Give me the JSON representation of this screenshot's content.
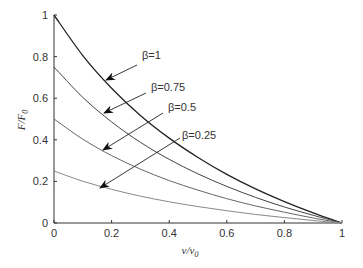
{
  "chart_data": {
    "type": "line",
    "title": "",
    "xlabel": "v/v0",
    "ylabel": "F/F0",
    "xlim": [
      0,
      1
    ],
    "ylim": [
      0,
      1
    ],
    "grid": false,
    "xticks": [
      "0",
      "0.2",
      "0.4",
      "0.6",
      "0.8",
      "1"
    ],
    "yticks": [
      "0",
      "0.2",
      "0.4",
      "0.6",
      "0.8",
      "1"
    ],
    "x": [
      0,
      0.1,
      0.2,
      0.3,
      0.4,
      0.5,
      0.6,
      0.7,
      0.8,
      0.9,
      1.0
    ],
    "series": [
      {
        "name": "β=1",
        "color": "#222222",
        "values": [
          1.0,
          0.805,
          0.648,
          0.517,
          0.408,
          0.315,
          0.234,
          0.164,
          0.103,
          0.049,
          0
        ]
      },
      {
        "name": "β=0.75",
        "color": "#444444",
        "values": [
          0.75,
          0.604,
          0.486,
          0.388,
          0.306,
          0.236,
          0.176,
          0.123,
          0.077,
          0.037,
          0
        ]
      },
      {
        "name": "β=0.5",
        "color": "#666666",
        "values": [
          0.5,
          0.403,
          0.324,
          0.259,
          0.204,
          0.158,
          0.117,
          0.082,
          0.052,
          0.024,
          0
        ]
      },
      {
        "name": "β=0.25",
        "color": "#888888",
        "values": [
          0.25,
          0.201,
          0.162,
          0.129,
          0.102,
          0.079,
          0.059,
          0.041,
          0.026,
          0.012,
          0
        ]
      }
    ],
    "annotations": [
      {
        "text": "β=1",
        "label_xy": [
          142,
          59
        ],
        "arrow_from": [
          137,
          65
        ],
        "arrow_to": [
          106,
          80
        ]
      },
      {
        "text": "β=0.75",
        "label_xy": [
          151,
          91
        ],
        "arrow_from": [
          146,
          93
        ],
        "arrow_to": [
          104,
          113
        ]
      },
      {
        "text": "β=0.5",
        "label_xy": [
          168,
          111
        ],
        "arrow_from": [
          163,
          113
        ],
        "arrow_to": [
          103,
          150
        ]
      },
      {
        "text": "β=0.25",
        "label_xy": [
          182,
          139
        ],
        "arrow_from": [
          180,
          138
        ],
        "arrow_to": [
          100,
          188
        ]
      }
    ]
  }
}
